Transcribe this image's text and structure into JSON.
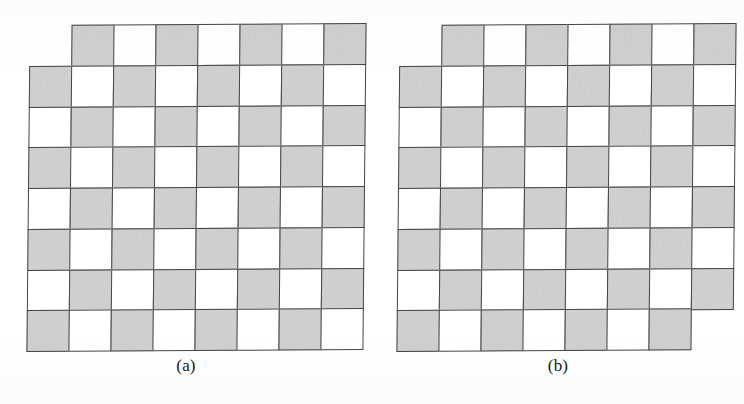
{
  "figure": {
    "background_color": "#ffffff",
    "shaded_color": "#c9c9c9",
    "unshaded_color": "#ffffff",
    "border_color": "#454545",
    "caption_color": "#17171a",
    "rows": 8,
    "columns": 8,
    "shading_rule": "shaded when (row + column) is odd",
    "cell_width_px": 42,
    "cell_height_px": 40.75
  },
  "boards": [
    {
      "id": "a",
      "caption": "(a)",
      "rows": 8,
      "columns": 8,
      "total_squares": 64,
      "missing_squares": [
        [
          0,
          0
        ]
      ],
      "remaining_squares": 63,
      "grid": [
        [
          "missing",
          "shaded",
          "white",
          "shaded",
          "white",
          "shaded",
          "white",
          "shaded"
        ],
        [
          "shaded",
          "white",
          "shaded",
          "white",
          "shaded",
          "white",
          "shaded",
          "white"
        ],
        [
          "white",
          "shaded",
          "white",
          "shaded",
          "white",
          "shaded",
          "white",
          "shaded"
        ],
        [
          "shaded",
          "white",
          "shaded",
          "white",
          "shaded",
          "white",
          "shaded",
          "white"
        ],
        [
          "white",
          "shaded",
          "white",
          "shaded",
          "white",
          "shaded",
          "white",
          "shaded"
        ],
        [
          "shaded",
          "white",
          "shaded",
          "white",
          "shaded",
          "white",
          "shaded",
          "white"
        ],
        [
          "white",
          "shaded",
          "white",
          "shaded",
          "white",
          "shaded",
          "white",
          "shaded"
        ],
        [
          "shaded",
          "white",
          "shaded",
          "white",
          "shaded",
          "white",
          "shaded",
          "white"
        ]
      ]
    },
    {
      "id": "b",
      "caption": "(b)",
      "rows": 8,
      "columns": 8,
      "total_squares": 64,
      "missing_squares": [
        [
          0,
          0
        ],
        [
          7,
          7
        ]
      ],
      "remaining_squares": 62,
      "grid": [
        [
          "missing",
          "shaded",
          "white",
          "shaded",
          "white",
          "shaded",
          "white",
          "shaded"
        ],
        [
          "shaded",
          "white",
          "shaded",
          "white",
          "shaded",
          "white",
          "shaded",
          "white"
        ],
        [
          "white",
          "shaded",
          "white",
          "shaded",
          "white",
          "shaded",
          "white",
          "shaded"
        ],
        [
          "shaded",
          "white",
          "shaded",
          "white",
          "shaded",
          "white",
          "shaded",
          "white"
        ],
        [
          "white",
          "shaded",
          "white",
          "shaded",
          "white",
          "shaded",
          "white",
          "shaded"
        ],
        [
          "shaded",
          "white",
          "shaded",
          "white",
          "shaded",
          "white",
          "shaded",
          "white"
        ],
        [
          "white",
          "shaded",
          "white",
          "shaded",
          "white",
          "shaded",
          "white",
          "shaded"
        ],
        [
          "shaded",
          "white",
          "shaded",
          "white",
          "shaded",
          "white",
          "shaded",
          "missing"
        ]
      ]
    }
  ]
}
